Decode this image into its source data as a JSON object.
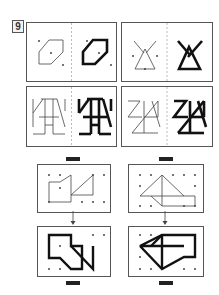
{
  "puzzle": {
    "number": "9",
    "description": "Dot-grid drawing practice: thin outline figure on left, bold traced figure on right",
    "colors": {
      "border": "#555555",
      "thin_line": "#444444",
      "bold_line": "#111111",
      "dot": "#333333",
      "bar": "#222222"
    }
  },
  "examples": [
    {
      "id": "hexagon",
      "position": "top-left"
    },
    {
      "id": "triangle-cross",
      "position": "top-right"
    },
    {
      "id": "ladder-figure",
      "position": "middle-left"
    },
    {
      "id": "star-figure",
      "position": "middle-right"
    }
  ],
  "exercises": [
    {
      "id": "exercise-left",
      "answer_blank": "—"
    },
    {
      "id": "exercise-right",
      "answer_blank": "—"
    }
  ]
}
